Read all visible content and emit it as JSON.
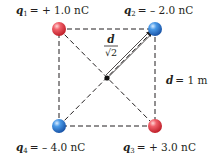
{
  "diagram": {
    "type": "point-charges-square",
    "charges": [
      {
        "id": "q1",
        "symbol": "q",
        "subscript": "1",
        "value_text": "= + 1.0 nC",
        "sign": "positive",
        "color": "#e0383f",
        "corner": "top-left"
      },
      {
        "id": "q2",
        "symbol": "q",
        "subscript": "2",
        "value_text": "= – 2.0 nC",
        "sign": "negative",
        "color": "#2f7fd6",
        "corner": "top-right"
      },
      {
        "id": "q3",
        "symbol": "q",
        "subscript": "3",
        "value_text": "= + 3.0 nC",
        "sign": "positive",
        "color": "#e0383f",
        "corner": "bottom-right"
      },
      {
        "id": "q4",
        "symbol": "q",
        "subscript": "4",
        "value_text": "= – 4.0 nC",
        "sign": "negative",
        "color": "#2f7fd6",
        "corner": "bottom-left"
      }
    ],
    "side_label": {
      "symbol": "d",
      "value_text": "= 1 m"
    },
    "diagonal_label": {
      "numerator": "d",
      "denominator": "√2"
    },
    "center_point": "center-of-square"
  }
}
